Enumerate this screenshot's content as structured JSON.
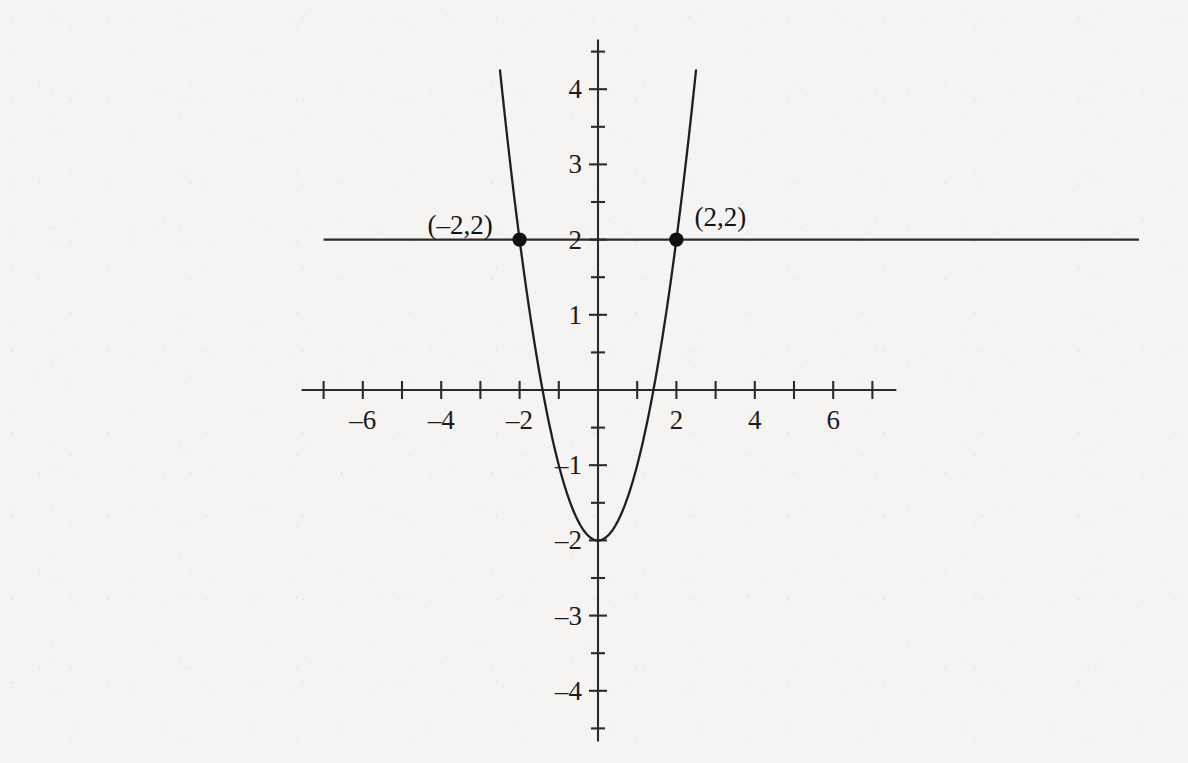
{
  "chart_data": {
    "type": "line",
    "title": "",
    "xlabel": "",
    "ylabel": "",
    "xlim": [
      -7.6,
      13.6
    ],
    "ylim": [
      -4.6,
      4.6
    ],
    "grid": false,
    "legend": null,
    "series": [
      {
        "name": "parabola",
        "equation": "y = x^2 - 2",
        "vertex": [
          0,
          -2
        ],
        "x_range": [
          -2.5,
          2.5
        ],
        "points": [
          [
            -2.5,
            4.25
          ],
          [
            -2.25,
            3.0625
          ],
          [
            -2,
            2
          ],
          [
            -1.75,
            1.0625
          ],
          [
            -1.5,
            0.25
          ],
          [
            -1.25,
            -0.4375
          ],
          [
            -1,
            -1
          ],
          [
            -0.75,
            -1.4375
          ],
          [
            -0.5,
            -1.75
          ],
          [
            -0.25,
            -1.9375
          ],
          [
            0,
            -2
          ],
          [
            0.25,
            -1.9375
          ],
          [
            0.5,
            -1.75
          ],
          [
            0.75,
            -1.4375
          ],
          [
            1,
            -1
          ],
          [
            1.25,
            -0.4375
          ],
          [
            1.5,
            0.25
          ],
          [
            1.75,
            1.0625
          ],
          [
            2,
            2
          ],
          [
            2.25,
            3.0625
          ],
          [
            2.5,
            4.25
          ]
        ]
      },
      {
        "name": "horizontal-line",
        "equation": "y = 2",
        "x_range": [
          -7.0,
          13.8
        ],
        "points": [
          [
            -7.0,
            2
          ],
          [
            13.8,
            2
          ]
        ]
      }
    ],
    "annotations": [
      {
        "label": "(–2,2)",
        "x": -2,
        "y": 2,
        "marker": "filled-circle",
        "label_position": "left"
      },
      {
        "label": "(2,2)",
        "x": 2,
        "y": 2,
        "marker": "filled-circle",
        "label_position": "upper-right"
      }
    ],
    "x_ticks": [
      -7,
      -6,
      -5,
      -4,
      -3,
      -2,
      -1,
      0,
      1,
      2,
      3,
      4,
      5,
      6,
      7
    ],
    "x_tick_labels": [
      {
        "value": -6,
        "text": "–6"
      },
      {
        "value": -4,
        "text": "–4"
      },
      {
        "value": -2,
        "text": "–2"
      },
      {
        "value": 2,
        "text": "2"
      },
      {
        "value": 4,
        "text": "4"
      },
      {
        "value": 6,
        "text": "6"
      }
    ],
    "y_ticks": [
      -4.5,
      -4,
      -3.5,
      -3,
      -2.5,
      -2,
      -1.5,
      -1,
      -0.5,
      0,
      0.5,
      1,
      1.5,
      2,
      2.5,
      3,
      3.5,
      4,
      4.5
    ],
    "y_tick_labels": [
      {
        "value": 4,
        "text": "4"
      },
      {
        "value": 3,
        "text": "3"
      },
      {
        "value": 2,
        "text": "2"
      },
      {
        "value": 1,
        "text": "1"
      },
      {
        "value": -1,
        "text": "–1"
      },
      {
        "value": -2,
        "text": "–2"
      },
      {
        "value": -3,
        "text": "–3"
      },
      {
        "value": -4,
        "text": "–4"
      }
    ],
    "colors": {
      "background": "#f5f4f2",
      "axis": "#2b2b2b",
      "curve": "#1f1f1f",
      "line": "#2b2b2b",
      "marker": "#111111",
      "text": "#1c1c1c"
    }
  }
}
